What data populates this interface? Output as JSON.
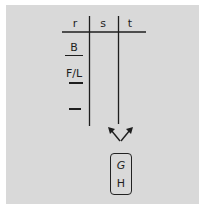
{
  "diagram": {
    "table": {
      "headers": [
        "r",
        "s",
        "t"
      ],
      "r_column_entries": [
        "B",
        "F/L",
        "—"
      ]
    },
    "arrows": {
      "description": "two arrows fanning upward from below column t"
    },
    "box": {
      "lines": [
        "G",
        "H"
      ]
    }
  },
  "colors": {
    "background": "#d9d9d9",
    "ink": "#1e1e1e",
    "border": "#ffffff"
  }
}
